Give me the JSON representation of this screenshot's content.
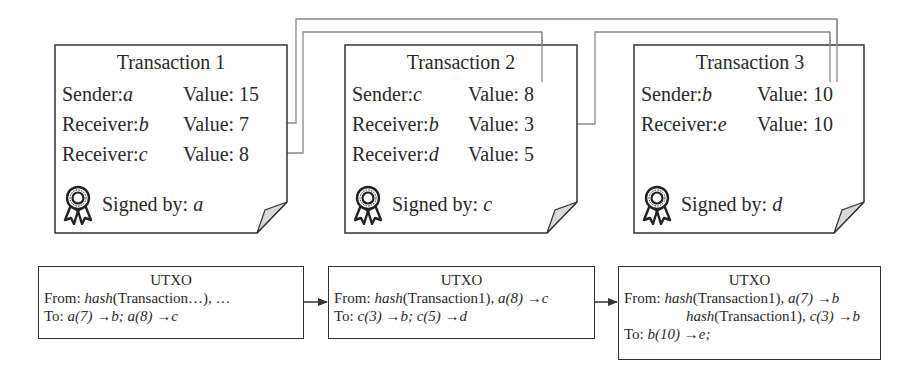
{
  "transactions": [
    {
      "title": "Transaction 1",
      "rows": [
        {
          "label": "Sender: ",
          "party": "a",
          "value_label": "Value: ",
          "value": "15"
        },
        {
          "label": "Receiver: ",
          "party": "b",
          "value_label": "Value: ",
          "value": "7"
        },
        {
          "label": "Receiver: ",
          "party": "c",
          "value_label": "Value: ",
          "value": "8"
        }
      ],
      "signed_label": "Signed by: ",
      "signer": "a"
    },
    {
      "title": "Transaction 2",
      "rows": [
        {
          "label": "Sender: ",
          "party": "c",
          "value_label": "Value: ",
          "value": "8"
        },
        {
          "label": "Receiver: ",
          "party": "b",
          "value_label": "Value: ",
          "value": "3"
        },
        {
          "label": "Receiver: ",
          "party": "d",
          "value_label": "Value: ",
          "value": "5"
        }
      ],
      "signed_label": "Signed by: ",
      "signer": "c"
    },
    {
      "title": "Transaction 3",
      "rows": [
        {
          "label": "Sender: ",
          "party": "b",
          "value_label": "Value: ",
          "value": "10"
        },
        {
          "label": "Receiver: ",
          "party": "e",
          "value_label": "Value: ",
          "value": "10"
        }
      ],
      "signed_label": "Signed by: ",
      "signer": "d"
    }
  ],
  "utxos": [
    {
      "title": "UTXO",
      "from_label": "From: ",
      "from": [
        {
          "hash_fn": "hash",
          "hash_arg": "(Transaction…), …",
          "spend": ""
        }
      ],
      "to_label": "To: ",
      "to": "a(7) →b; a(8) →c"
    },
    {
      "title": "UTXO",
      "from_label": "From: ",
      "from": [
        {
          "hash_fn": "hash",
          "hash_arg": "(Transaction1), ",
          "spend": "a(8) →c"
        }
      ],
      "to_label": "To: ",
      "to": "c(3) →b; c(5) →d"
    },
    {
      "title": "UTXO",
      "from_label": "From: ",
      "from": [
        {
          "hash_fn": "hash",
          "hash_arg": "(Transaction1), ",
          "spend": "a(7) →b"
        },
        {
          "hash_fn": "hash",
          "hash_arg": "(Transaction1), ",
          "spend": "c(3) →b"
        }
      ],
      "to_label": "To: ",
      "to": "b(10) →e;"
    }
  ],
  "icons": {
    "signature": "award-ribbon-icon",
    "corner": "page-fold-icon"
  },
  "colors": {
    "stroke": "#333333",
    "connector": "#8a8a8a",
    "fold_fill": "#d9d9d9"
  }
}
